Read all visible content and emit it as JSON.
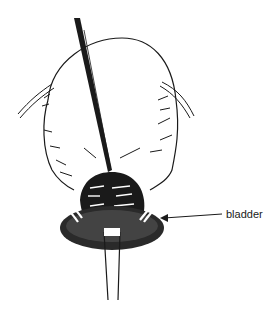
{
  "diagram": {
    "labels": [
      {
        "text": "bladder",
        "target": "bladder"
      }
    ],
    "colors": {
      "ink": "#1a1a1a",
      "background": "#ffffff"
    }
  }
}
